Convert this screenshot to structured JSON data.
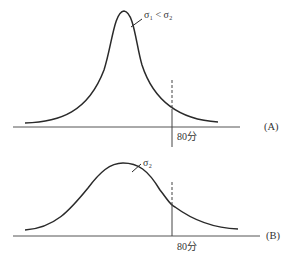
{
  "diagram": {
    "panels": [
      {
        "id": "A",
        "panel_label": "(A)",
        "curve_label": "σ₁ < σ₂",
        "marker_label": "80分",
        "description": "narrow, tall normal curve"
      },
      {
        "id": "B",
        "panel_label": "(B)",
        "curve_label": "σ₂",
        "marker_label": "80分",
        "description": "wide, flat normal curve"
      }
    ],
    "colors": {
      "line": "#2a2a2a",
      "axis": "#555555",
      "background": "#ffffff"
    }
  }
}
